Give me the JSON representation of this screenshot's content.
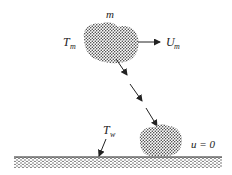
{
  "diagram": {
    "type": "schematic",
    "labels": {
      "mass": "m",
      "main_temp": "T",
      "main_temp_sub": "m",
      "main_velocity": "U",
      "main_velocity_sub": "m",
      "wall_temp": "T",
      "wall_temp_sub": "w",
      "wall_velocity": "u = 0"
    },
    "colors": {
      "ink": "#222222",
      "stipple": "#333333",
      "background": "#ffffff"
    }
  }
}
